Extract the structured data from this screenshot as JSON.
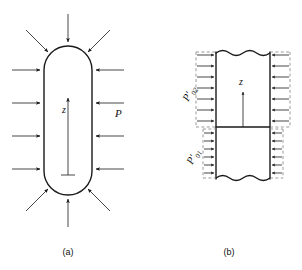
{
  "figure": {
    "panels": [
      {
        "id": "panel-a",
        "caption": "(a)",
        "axis_label": "z",
        "pressure_label": "P",
        "shape": "capsule",
        "arrow_counts": {
          "left": 4,
          "right": 4,
          "top": 3,
          "bottom": 3
        }
      },
      {
        "id": "panel-b",
        "caption": "(b)",
        "axis_label": "z",
        "pressure_upper_base": "P",
        "pressure_upper_prime": "′",
        "pressure_upper_sub": "02",
        "pressure_lower_base": "P",
        "pressure_lower_prime": "′",
        "pressure_lower_sub": "01",
        "shape": "wavy-column",
        "arrow_counts": {
          "upper_left": 7,
          "upper_right": 7,
          "lower_left": 6,
          "lower_right": 6
        }
      }
    ],
    "colors": {
      "line": "#1a1a1a",
      "dashed": "#8a8a8a",
      "background": "#ffffff",
      "text": "#111111"
    }
  }
}
